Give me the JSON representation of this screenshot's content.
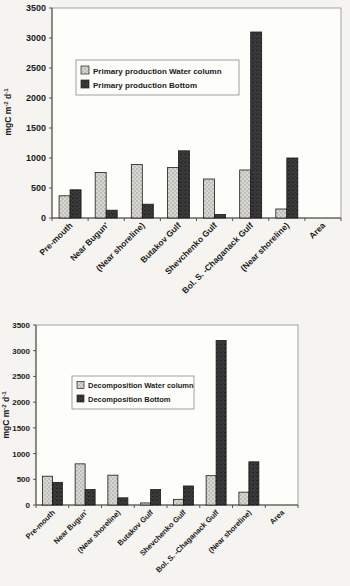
{
  "colors": {
    "paper_background": "#f5f4f0",
    "plot_background": "#fdfdfa",
    "water_column_fill": "#d8d7d2",
    "water_column_dot": "#8c8b86",
    "bottom_fill": "#3b3b3b",
    "bottom_speckle": "#161616",
    "bar_outline": "#1a1a1a",
    "axis_color": "#49483f",
    "text_color": "#1b1b1b"
  },
  "chart_data": [
    {
      "type": "bar",
      "title": "",
      "xlabel": "",
      "ylabel": "mgC m-2 d-1",
      "ylabel_parts": [
        "mgC m",
        "-2",
        " d",
        "-1"
      ],
      "ylim": [
        0,
        3500
      ],
      "ytick_step": 500,
      "ytick_labels": [
        "0",
        "500",
        "1000",
        "1500",
        "2000",
        "2500",
        "3000",
        "3500"
      ],
      "grid": false,
      "legend_position": "inside upper left",
      "categories": [
        "Pre-mouth",
        "Near Bugun'",
        "(Near shoreline)",
        "Butakov Gulf",
        "Shevchenko Gulf",
        "Bol. S. -Chaganack Gulf",
        "(Near shoreline)",
        "Area"
      ],
      "series": [
        {
          "name": "Primary production Water column",
          "values": [
            370,
            760,
            890,
            840,
            650,
            800,
            150,
            0
          ]
        },
        {
          "name": "Primary production Bottom",
          "values": [
            470,
            130,
            230,
            1120,
            60,
            3100,
            1000,
            0
          ]
        }
      ]
    },
    {
      "type": "bar",
      "title": "",
      "xlabel": "",
      "ylabel": "mgC m-2 d-1",
      "ylabel_parts": [
        "mgC m",
        "-2",
        " d",
        "-1"
      ],
      "ylim": [
        0,
        3500
      ],
      "ytick_step": 500,
      "ytick_labels": [
        "0",
        "500",
        "1000",
        "1500",
        "2000",
        "2500",
        "3000",
        "3500"
      ],
      "grid": false,
      "legend_position": "inside upper left",
      "categories": [
        "Pre-mouth",
        "Near Bugun'",
        "(Near shoreline)",
        "Butakov Gulf",
        "Shevchenko Gulf",
        "Bol. S. -Chaganack Gulf",
        "(Near shoreline)",
        "Area"
      ],
      "series": [
        {
          "name": "Decomposition Water column",
          "values": [
            560,
            800,
            580,
            40,
            110,
            570,
            250,
            0
          ]
        },
        {
          "name": "Decomposition Bottom",
          "values": [
            440,
            300,
            140,
            300,
            370,
            3200,
            840,
            0
          ]
        }
      ]
    }
  ]
}
